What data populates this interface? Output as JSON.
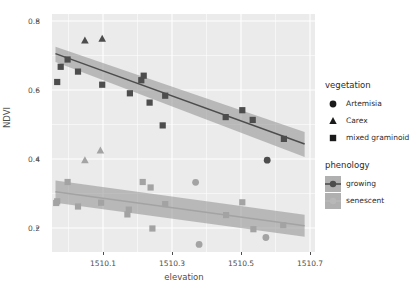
{
  "chart_data": {
    "type": "scatter",
    "title": "",
    "xlabel": "elevation",
    "ylabel": "NDVI",
    "xlim": [
      1510.01,
      1510.77
    ],
    "ylim": [
      0.13,
      0.82
    ],
    "xticks": [
      1510.1,
      1510.3,
      1510.5,
      1510.7
    ],
    "xtick_labels": [
      "1510.1",
      "1510.3",
      "1510.5",
      "1510.7"
    ],
    "yticks": [
      0.2,
      0.4,
      0.6,
      0.8
    ],
    "ytick_labels": [
      "0.2",
      "0.4",
      "0.6",
      "0.8"
    ],
    "grid": true,
    "legend_position": "right",
    "series": [
      {
        "name": "growing",
        "phenology": "growing",
        "color": "#4d4d4d",
        "fit": {
          "x": [
            1510.02,
            1510.74
          ],
          "y": [
            0.705,
            0.443
          ],
          "ci_upper": [
            0.725,
            0.478
          ],
          "ci_lower": [
            0.681,
            0.405
          ]
        },
        "points": [
          {
            "x": 1510.035,
            "y": 0.667,
            "vegetation": "mixed graminoid"
          },
          {
            "x": 1510.025,
            "y": 0.623,
            "vegetation": "mixed graminoid"
          },
          {
            "x": 1510.055,
            "y": 0.688,
            "vegetation": "mixed graminoid"
          },
          {
            "x": 1510.085,
            "y": 0.653,
            "vegetation": "mixed graminoid"
          },
          {
            "x": 1510.105,
            "y": 0.743,
            "vegetation": "Carex"
          },
          {
            "x": 1510.155,
            "y": 0.748,
            "vegetation": "Carex"
          },
          {
            "x": 1510.155,
            "y": 0.615,
            "vegetation": "mixed graminoid"
          },
          {
            "x": 1510.235,
            "y": 0.59,
            "vegetation": "mixed graminoid"
          },
          {
            "x": 1510.268,
            "y": 0.628,
            "vegetation": "mixed graminoid"
          },
          {
            "x": 1510.275,
            "y": 0.641,
            "vegetation": "mixed graminoid"
          },
          {
            "x": 1510.292,
            "y": 0.563,
            "vegetation": "mixed graminoid"
          },
          {
            "x": 1510.337,
            "y": 0.583,
            "vegetation": "mixed graminoid"
          },
          {
            "x": 1510.33,
            "y": 0.497,
            "vegetation": "mixed graminoid"
          },
          {
            "x": 1510.512,
            "y": 0.521,
            "vegetation": "mixed graminoid"
          },
          {
            "x": 1510.56,
            "y": 0.541,
            "vegetation": "mixed graminoid"
          },
          {
            "x": 1510.59,
            "y": 0.513,
            "vegetation": "mixed graminoid"
          },
          {
            "x": 1510.632,
            "y": 0.396,
            "vegetation": "Artemisia"
          },
          {
            "x": 1510.68,
            "y": 0.458,
            "vegetation": "mixed graminoid"
          }
        ]
      },
      {
        "name": "senescent",
        "phenology": "senescent",
        "color": "#a3a3a3",
        "fit": {
          "x": [
            1510.02,
            1510.74
          ],
          "y": [
            0.305,
            0.206
          ],
          "ci_upper": [
            0.337,
            0.238
          ],
          "ci_lower": [
            0.273,
            0.174
          ]
        },
        "points": [
          {
            "x": 1510.105,
            "y": 0.396,
            "vegetation": "Carex"
          },
          {
            "x": 1510.15,
            "y": 0.424,
            "vegetation": "Carex"
          },
          {
            "x": 1510.055,
            "y": 0.333,
            "vegetation": "mixed graminoid"
          },
          {
            "x": 1510.025,
            "y": 0.277,
            "vegetation": "mixed graminoid"
          },
          {
            "x": 1510.022,
            "y": 0.272,
            "vegetation": "mixed graminoid"
          },
          {
            "x": 1510.085,
            "y": 0.262,
            "vegetation": "mixed graminoid"
          },
          {
            "x": 1510.152,
            "y": 0.273,
            "vegetation": "mixed graminoid"
          },
          {
            "x": 1510.232,
            "y": 0.253,
            "vegetation": "mixed graminoid"
          },
          {
            "x": 1510.228,
            "y": 0.239,
            "vegetation": "mixed graminoid"
          },
          {
            "x": 1510.272,
            "y": 0.333,
            "vegetation": "mixed graminoid"
          },
          {
            "x": 1510.295,
            "y": 0.317,
            "vegetation": "mixed graminoid"
          },
          {
            "x": 1510.3,
            "y": 0.198,
            "vegetation": "mixed graminoid"
          },
          {
            "x": 1510.337,
            "y": 0.269,
            "vegetation": "mixed graminoid"
          },
          {
            "x": 1510.425,
            "y": 0.332,
            "vegetation": "Artemisia"
          },
          {
            "x": 1510.435,
            "y": 0.152,
            "vegetation": "Artemisia"
          },
          {
            "x": 1510.513,
            "y": 0.237,
            "vegetation": "mixed graminoid"
          },
          {
            "x": 1510.56,
            "y": 0.274,
            "vegetation": "mixed graminoid"
          },
          {
            "x": 1510.592,
            "y": 0.196,
            "vegetation": "mixed graminoid"
          },
          {
            "x": 1510.628,
            "y": 0.172,
            "vegetation": "Artemisia"
          },
          {
            "x": 1510.678,
            "y": 0.208,
            "vegetation": "mixed graminoid"
          }
        ]
      }
    ]
  },
  "axes": {
    "y_title": "NDVI",
    "x_title": "elevation",
    "y_labels": [
      "0.8",
      "0.6",
      "0.4",
      "0.2"
    ],
    "x_labels": [
      "1510.1",
      "1510.3",
      "1510.5",
      "1510.7"
    ]
  },
  "legends": {
    "vegetation": {
      "title": "vegetation",
      "items": [
        {
          "label": "Artemisia",
          "shape": "circle-icon"
        },
        {
          "label": "Carex",
          "shape": "triangle-icon"
        },
        {
          "label": "mixed graminoid",
          "shape": "square-icon"
        }
      ]
    },
    "phenology": {
      "title": "phenology",
      "items": [
        {
          "label": "growing",
          "color": "#4d4d4d"
        },
        {
          "label": "senescent",
          "color": "#a3a3a3"
        }
      ]
    }
  },
  "colors": {
    "panel_background": "#ebebeb",
    "gridline": "#ffffff",
    "growing": "#4d4d4d",
    "senescent": "#a3a3a3",
    "ribbon": "#9a9a9a",
    "text": "#4d4d4d"
  }
}
